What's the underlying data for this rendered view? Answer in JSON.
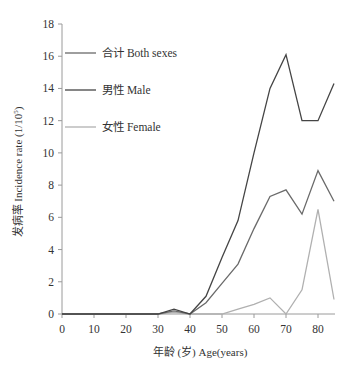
{
  "chart_data": {
    "type": "line",
    "title": "",
    "xlabel": "年龄 (岁) Age(years)",
    "ylabel": "发病率 Incidence rate (1/10⁵)",
    "xlim": [
      0,
      85
    ],
    "ylim": [
      0,
      18
    ],
    "x_ticks": [
      0,
      10,
      20,
      30,
      40,
      50,
      60,
      70,
      80
    ],
    "y_ticks": [
      0,
      2,
      4,
      6,
      8,
      10,
      12,
      14,
      16,
      18
    ],
    "grid": false,
    "legend_position": "upper-left",
    "x": [
      0,
      5,
      10,
      15,
      20,
      25,
      30,
      35,
      40,
      45,
      50,
      55,
      60,
      65,
      70,
      75,
      80,
      85
    ],
    "series": [
      {
        "name": "合计 Both sexes",
        "color": "#6a6a6a",
        "values": [
          0,
          0,
          0,
          0,
          0,
          0,
          0,
          0.2,
          0,
          0.7,
          1.9,
          3.1,
          5.3,
          7.3,
          7.7,
          6.2,
          8.9,
          7.0
        ]
      },
      {
        "name": "男性 Male",
        "color": "#454545",
        "values": [
          0,
          0,
          0,
          0,
          0,
          0,
          0,
          0.3,
          0,
          1.1,
          3.5,
          5.8,
          10.0,
          14.0,
          16.1,
          12.0,
          12.0,
          14.3
        ]
      },
      {
        "name": "女性 Female",
        "color": "#b0b0b0",
        "values": [
          0,
          0,
          0,
          0,
          0,
          0,
          0,
          0.1,
          0,
          0,
          0,
          0.3,
          0.6,
          1.0,
          0,
          1.5,
          6.5,
          0.9
        ]
      }
    ]
  },
  "legend": {
    "items": [
      {
        "label": "合计  Both sexes",
        "color": "#6a6a6a"
      },
      {
        "label": "男性  Male",
        "color": "#454545"
      },
      {
        "label": "女性  Female",
        "color": "#b0b0b0"
      }
    ]
  },
  "axes": {
    "x_title": "年龄 (岁) Age(years)",
    "y_title_main": "发病率 Incidence  rate (1/10",
    "y_title_sup": "5",
    "y_title_end": ")"
  }
}
